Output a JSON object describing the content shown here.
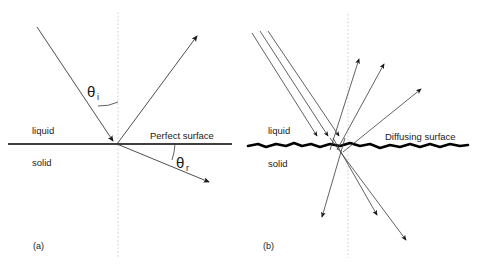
{
  "figure": {
    "background_color": "#ffffff",
    "ray_color": "#3a3a3a",
    "surface_color": "#000000",
    "normal_color": "#cccccc",
    "text_color": "#1a1a1a",
    "width": 477,
    "height": 271
  },
  "panels": [
    {
      "id": "a",
      "caption": "(a)",
      "caption_pos": {
        "x": 33,
        "y": 247
      },
      "surface_label": "Perfect surface",
      "surface_label_pos": {
        "x": 150,
        "y": 139
      },
      "surface_type": "smooth",
      "upper_medium": "liquid",
      "upper_medium_pos": {
        "x": 32,
        "y": 131
      },
      "lower_medium": "solid",
      "lower_medium_pos": {
        "x": 32,
        "y": 163
      },
      "surface_line": {
        "x1": 8,
        "y1": 144,
        "x2": 232,
        "y2": 144
      },
      "normal_line": {
        "x": 118,
        "y1": 12,
        "y2": 258
      },
      "origin": {
        "x": 117,
        "y": 144
      },
      "angles": [
        {
          "name": "theta-incident",
          "symbol": "θ",
          "subscript": "i",
          "label_pos": {
            "x": 93,
            "y": 94
          },
          "arc": {
            "from_deg": 242,
            "to_deg": 270,
            "radius": 42
          }
        },
        {
          "name": "theta-refracted",
          "symbol": "θ",
          "subscript": "r",
          "label_pos": {
            "x": 181,
            "y": 165
          },
          "arc": {
            "from_deg": 0,
            "to_deg": 22,
            "radius": 58
          }
        }
      ],
      "rays": [
        {
          "name": "incident-ray",
          "x1": 37,
          "y1": 27,
          "x2": 117,
          "y2": 144,
          "arrow": "end",
          "arrow_at_origin": true
        },
        {
          "name": "reflected-ray",
          "x1": 117,
          "y1": 144,
          "x2": 199,
          "y2": 33,
          "arrow": "end"
        },
        {
          "name": "refracted-ray",
          "x1": 117,
          "y1": 144,
          "x2": 212,
          "y2": 184,
          "arrow": "end"
        }
      ]
    },
    {
      "id": "b",
      "caption": "(b)",
      "caption_pos": {
        "x": 263,
        "y": 247
      },
      "surface_label": "Diffusing surface",
      "surface_label_pos": {
        "x": 385,
        "y": 140
      },
      "surface_type": "rough",
      "upper_medium": "liquid",
      "upper_medium_pos": {
        "x": 268,
        "y": 131
      },
      "lower_medium": "solid",
      "lower_medium_pos": {
        "x": 268,
        "y": 164
      },
      "surface_line": {
        "x1": 248,
        "y1": 145,
        "x2": 468,
        "y2": 145
      },
      "normal_line": {
        "x": 348,
        "y1": 14,
        "y2": 258
      },
      "incident_count": 3,
      "scattered_up_count": 3,
      "scattered_down_count": 3,
      "rays": [
        {
          "name": "incident-ray-1",
          "x1": 252,
          "y1": 33,
          "x2": 320,
          "y2": 140,
          "arrow": "end"
        },
        {
          "name": "incident-ray-2",
          "x1": 260,
          "y1": 31,
          "x2": 331,
          "y2": 140,
          "arrow": "end"
        },
        {
          "name": "incident-ray-3",
          "x1": 268,
          "y1": 31,
          "x2": 342,
          "y2": 140,
          "arrow": "end"
        },
        {
          "name": "scattered-up-ray-1",
          "x1": 330,
          "y1": 150,
          "x2": 360,
          "y2": 55,
          "arrow": "end"
        },
        {
          "name": "scattered-up-ray-2",
          "x1": 337,
          "y1": 150,
          "x2": 386,
          "y2": 60,
          "arrow": "end"
        },
        {
          "name": "scattered-up-ray-3",
          "x1": 343,
          "y1": 152,
          "x2": 424,
          "y2": 86,
          "arrow": "end"
        },
        {
          "name": "scattered-down-ray-1",
          "x1": 344,
          "y1": 140,
          "x2": 320,
          "y2": 222,
          "arrow": "end"
        },
        {
          "name": "scattered-down-ray-2",
          "x1": 333,
          "y1": 140,
          "x2": 380,
          "y2": 220,
          "arrow": "end"
        },
        {
          "name": "scattered-down-ray-3",
          "x1": 330,
          "y1": 140,
          "x2": 410,
          "y2": 245,
          "arrow": "end"
        }
      ]
    }
  ]
}
